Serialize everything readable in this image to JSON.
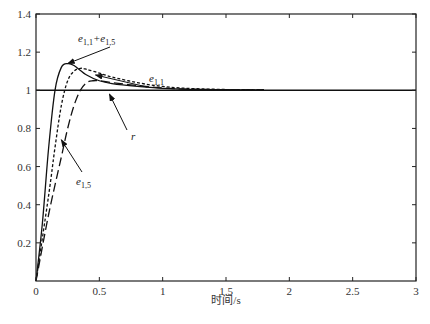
{
  "chart_data": {
    "type": "line",
    "title": "",
    "xlabel": "时间/s",
    "ylabel": "",
    "xlim": [
      0,
      3
    ],
    "ylim": [
      0,
      1.4
    ],
    "grid": false,
    "legend": "none (inline annotations with arrows)",
    "x_ticks": [
      "0",
      "0.5",
      "1",
      "1.5",
      "2",
      "2.5",
      "3"
    ],
    "y_ticks": [
      "0.2",
      "0.4",
      "0.6",
      "0.8",
      "1",
      "1.2",
      "1.4"
    ],
    "series": [
      {
        "name": "r",
        "style": "solid",
        "x": [
          0,
          3
        ],
        "y": [
          1,
          1
        ]
      },
      {
        "name": "e_{1,1}+e_{1,5}",
        "style": "solid",
        "x": [
          0,
          0.05,
          0.1,
          0.15,
          0.2,
          0.25,
          0.3,
          0.4,
          0.5,
          0.6,
          0.8,
          1.0,
          1.2,
          1.5,
          1.8
        ],
        "y": [
          0,
          0.3,
          0.7,
          1.0,
          1.12,
          1.14,
          1.13,
          1.08,
          1.05,
          1.035,
          1.02,
          1.01,
          1.005,
          1.003,
          1.002
        ]
      },
      {
        "name": "e_{1,1}",
        "style": "dotted",
        "x": [
          0,
          0.1,
          0.15,
          0.2,
          0.25,
          0.3,
          0.35,
          0.4,
          0.5,
          0.6,
          0.8,
          1.0,
          1.2,
          1.5,
          1.8
        ],
        "y": [
          0,
          0.45,
          0.7,
          0.92,
          1.05,
          1.1,
          1.115,
          1.11,
          1.09,
          1.07,
          1.04,
          1.02,
          1.01,
          1.004,
          1.002
        ]
      },
      {
        "name": "e_{1,5}",
        "style": "dashed",
        "x": [
          0,
          0.1,
          0.2,
          0.25,
          0.3,
          0.35,
          0.4,
          0.45,
          0.5,
          0.6,
          0.8,
          1.0,
          1.2,
          1.5,
          1.8
        ],
        "y": [
          0,
          0.35,
          0.65,
          0.8,
          0.92,
          1.0,
          1.04,
          1.05,
          1.05,
          1.04,
          1.025,
          1.012,
          1.006,
          1.003,
          1.002
        ]
      }
    ],
    "annotations": [
      {
        "text": "e_{1,1}+e_{1,5}",
        "base": "e",
        "sub": "1,1",
        "plus": "+e",
        "sub2": "1,5",
        "points_to": [
          0.25,
          1.14
        ]
      },
      {
        "text": "e_{1,1}",
        "base": "e",
        "sub": "1,1",
        "points_to": [
          0.47,
          1.08
        ]
      },
      {
        "text": "r",
        "base": "r",
        "points_to": [
          0.58,
          0.98
        ]
      },
      {
        "text": "e_{1,5}",
        "base": "e",
        "sub": "1,5",
        "points_to": [
          0.2,
          0.74
        ]
      }
    ]
  },
  "axes": {
    "xlabel": "时间/s"
  }
}
